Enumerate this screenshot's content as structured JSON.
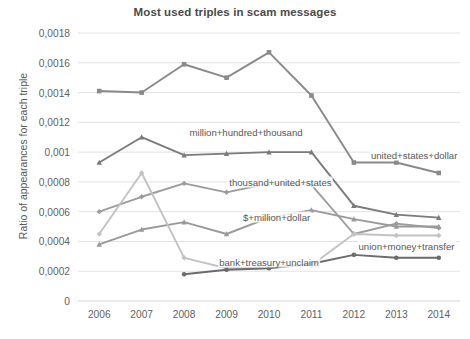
{
  "chart_data": {
    "type": "line",
    "title": "Most used triples in scam messages",
    "xlabel": "",
    "ylabel": "Ratio of appearances for each triple",
    "categories": [
      "2006",
      "2007",
      "2008",
      "2009",
      "2010",
      "2011",
      "2012",
      "2013",
      "2014"
    ],
    "x": [
      2006,
      2007,
      2008,
      2009,
      2010,
      2011,
      2012,
      2013,
      2014
    ],
    "ylim": [
      0,
      0.0018
    ],
    "ytick_labels": [
      "0",
      "0,0002",
      "0,0004",
      "0,0006",
      "0,0008",
      "0,001",
      "0,0012",
      "0,0014",
      "0,0016",
      "0,0018"
    ],
    "ytick_values": [
      0,
      0.0002,
      0.0004,
      0.0006,
      0.0008,
      0.001,
      0.0012,
      0.0014,
      0.0016,
      0.0018
    ],
    "grid": true,
    "legend": "inline-annotations",
    "series": [
      {
        "name": "united+states+dollar",
        "color": "#8a8a8a",
        "marker": "square",
        "values": [
          0.00141,
          0.0014,
          0.00159,
          0.0015,
          0.00167,
          0.00138,
          0.00093,
          0.00093,
          0.00086
        ]
      },
      {
        "name": "million+hundred+thousand",
        "color": "#7b7b7b",
        "marker": "triangle",
        "values": [
          0.00093,
          0.0011,
          0.00098,
          0.00099,
          0.001,
          0.001,
          0.00064,
          0.00058,
          0.00056
        ]
      },
      {
        "name": "thousand+united+states",
        "color": "#9c9c9c",
        "marker": "diamond",
        "values": [
          0.0006,
          0.0007,
          0.00079,
          0.00073,
          0.00079,
          0.00078,
          0.00045,
          0.00052,
          0.00049
        ]
      },
      {
        "name": "$+million+dollar",
        "color": "#9a9a9a",
        "marker": "triangle",
        "values": [
          0.00038,
          0.00048,
          0.00053,
          0.00045,
          0.00056,
          0.00061,
          0.00055,
          0.0005,
          0.0005
        ]
      },
      {
        "name": "bank+treasury+unclaim",
        "color": "#c2c2c2",
        "marker": "diamond",
        "values": [
          0.00045,
          0.00086,
          0.00029,
          0.00022,
          0.00023,
          0.00024,
          0.00045,
          0.00044,
          0.00044
        ]
      },
      {
        "name": "union+money+transfer",
        "color": "#6b6b6b",
        "marker": "circle",
        "values": [
          null,
          null,
          0.00018,
          0.00021,
          0.00022,
          0.00025,
          0.00031,
          0.00029,
          0.00029
        ]
      }
    ],
    "annotations": [
      {
        "text": "million+hundred+thousand",
        "x": 0.44,
        "y": 0.37
      },
      {
        "text": "united+states+dollar",
        "x": 0.88,
        "y": 0.455
      },
      {
        "text": "thousand+united+states",
        "x": 0.53,
        "y": 0.555
      },
      {
        "text": "$+million+dollar",
        "x": 0.52,
        "y": 0.685
      },
      {
        "text": "union+money+transfer",
        "x": 0.86,
        "y": 0.795
      },
      {
        "text": "bank+treasury+unclaim",
        "x": 0.5,
        "y": 0.855
      }
    ]
  },
  "caption": {
    "text": ""
  }
}
